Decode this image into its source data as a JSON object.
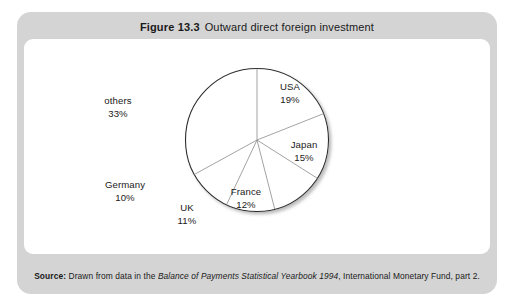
{
  "figure": {
    "number": "Figure 13.3",
    "title": "Outward direct foreign investment"
  },
  "source": {
    "label": "Source:",
    "lead": "Drawn from data in the",
    "italic": "Balance of Payments Statistical Yearbook 1994",
    "tail": ", International Monetary Fund, part 2."
  },
  "chart_data": {
    "type": "pie",
    "title": "Outward direct foreign investment",
    "subtitle": "",
    "xlabel": "",
    "ylabel": "",
    "legend_position": "none",
    "grid": false,
    "start_angle_deg": 0,
    "direction": "clockwise",
    "unit": "%",
    "categories": [
      "USA",
      "Japan",
      "France",
      "UK",
      "Germany",
      "others"
    ],
    "values": [
      19,
      15,
      12,
      11,
      10,
      33
    ],
    "slices": [
      {
        "label": "USA",
        "value": 19,
        "display": "19%",
        "label_x": 266,
        "label_y": 42
      },
      {
        "label": "Japan",
        "value": 15,
        "display": "15%",
        "label_x": 280,
        "label_y": 100
      },
      {
        "label": "France",
        "value": 12,
        "display": "12%",
        "label_x": 222,
        "label_y": 147
      },
      {
        "label": "UK",
        "value": 11,
        "display": "11%",
        "label_x": 163,
        "label_y": 163
      },
      {
        "label": "Germany",
        "value": 10,
        "display": "10%",
        "label_x": 101,
        "label_y": 140
      },
      {
        "label": "others",
        "value": 33,
        "display": "33%",
        "label_x": 94,
        "label_y": 56
      }
    ],
    "colors": {
      "slice_fill": "#ffffff",
      "outline": "#2b2b2b",
      "divider": "#8c8c8c"
    }
  }
}
